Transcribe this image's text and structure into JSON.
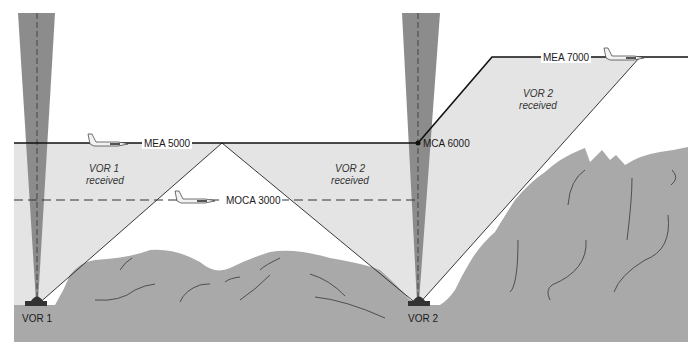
{
  "diagram": {
    "labels": {
      "mea_low": "MEA 5000",
      "mea_high": "MEA 7000",
      "mca": "MCA 6000",
      "moca": "MOCA 3000",
      "vor1_station": "VOR 1",
      "vor2_station": "VOR 2",
      "vor1_received_line1": "VOR 1",
      "vor1_received_line2": "received",
      "vor2_received_line1": "VOR 2",
      "vor2_received_line2": "received",
      "vor2_high_received_line1": "VOR 2",
      "vor2_high_received_line2": "received"
    },
    "altitudes": {
      "mea_low_ft": 5000,
      "mca_ft": 6000,
      "mea_high_ft": 7000,
      "moca_ft": 3000
    },
    "colors": {
      "background": "#ffffff",
      "reception_area": "#e4e4e4",
      "terrain": "#a9a9a9",
      "cone_of_confusion": "#8c8c8c",
      "line": "#111111",
      "station": "#333333"
    },
    "elements": [
      {
        "type": "vor-station",
        "name": "VOR 1",
        "x": 37
      },
      {
        "type": "vor-station",
        "name": "VOR 2",
        "x": 418
      },
      {
        "type": "route-segment",
        "label": "MEA 5000",
        "from_x": 14,
        "to_x": 418
      },
      {
        "type": "climb-point",
        "label": "MCA 6000",
        "x": 418
      },
      {
        "type": "route-segment",
        "label": "MEA 7000",
        "from_x": 492,
        "to_x": 688
      },
      {
        "type": "dashed-line",
        "label": "MOCA 3000",
        "from_x": 14,
        "to_x": 418
      },
      {
        "type": "aircraft",
        "at": "MEA 5000"
      },
      {
        "type": "aircraft",
        "at": "MOCA 3000"
      },
      {
        "type": "aircraft",
        "at": "MEA 7000"
      }
    ]
  }
}
